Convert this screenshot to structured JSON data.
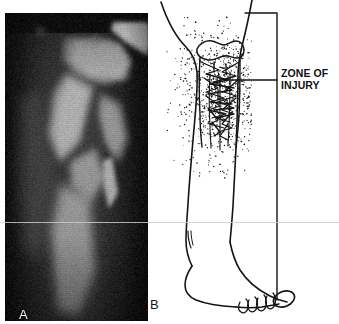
{
  "figure": {
    "width": 339,
    "height": 324,
    "background": "#ffffff",
    "ink_color": "#111111",
    "panels": [
      {
        "id": "A",
        "label": "A",
        "kind": "radiograph",
        "label_color": "#f2f2f2",
        "description": "Anteroposterior radiograph of proximal tibia showing comminuted fracture"
      },
      {
        "id": "B",
        "label": "B",
        "kind": "line-drawing",
        "label_color": "#161616",
        "description": "Line drawing of lower leg and foot with stippled soft-tissue zone of injury"
      }
    ]
  },
  "annotation": {
    "zone_label_line1": "ZONE OF",
    "zone_label_line2": "INJURY",
    "bracket_color": "#111111",
    "leader_color": "#111111"
  },
  "xray": {
    "panel_label": "A",
    "base_tone": "#141414",
    "bone_tone": "#b9b9b9",
    "bright_tone": "#f4f4f4",
    "left": 5,
    "top": 13,
    "width": 143,
    "height": 308
  },
  "drawing": {
    "panel_label": "B",
    "stipple_color": "#1a1a1a",
    "outline_color": "#141414",
    "toe_count_small": 4,
    "great_toe": "ellipse"
  }
}
